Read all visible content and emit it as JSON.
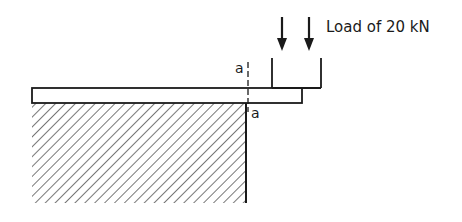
{
  "diagram": {
    "load_label": "Load of 20 kN",
    "section_label_top": "a",
    "section_label_bottom": "a",
    "colors": {
      "line": "#1a1a1a",
      "hatch": "#555555",
      "background": "#ffffff"
    },
    "elements": {
      "wall": {
        "type": "hatched-support",
        "x": 32,
        "y": 103,
        "width": 214,
        "height": 100
      },
      "beam": {
        "type": "cantilever",
        "x": 32,
        "y": 88,
        "width": 270,
        "height": 15
      },
      "load_block": {
        "left_x": 272,
        "right_x": 321,
        "top_y": 58,
        "bottom_y": 88
      },
      "arrows": [
        {
          "x": 282,
          "y1": 17,
          "y2": 51
        },
        {
          "x": 309,
          "y1": 17,
          "y2": 51
        }
      ],
      "section_line": {
        "x": 248,
        "y1": 62,
        "y2": 112,
        "style": "dashed"
      }
    }
  }
}
